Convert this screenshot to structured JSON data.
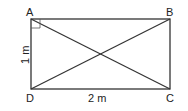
{
  "diagram": {
    "type": "geometry",
    "shape": "rectangle with diagonals",
    "vertices": [
      {
        "label": "A",
        "x": 31,
        "y": 19
      },
      {
        "label": "B",
        "x": 170,
        "y": 19
      },
      {
        "label": "C",
        "x": 170,
        "y": 89
      },
      {
        "label": "D",
        "x": 31,
        "y": 89
      }
    ],
    "dimensions": {
      "width_label": "2 m",
      "height_label": "1 m"
    },
    "right_angle_marker": "A",
    "diagonals": [
      "AC",
      "BD"
    ],
    "colors": {
      "line": "#333333",
      "text": "#222222",
      "background": "#ffffff"
    }
  }
}
